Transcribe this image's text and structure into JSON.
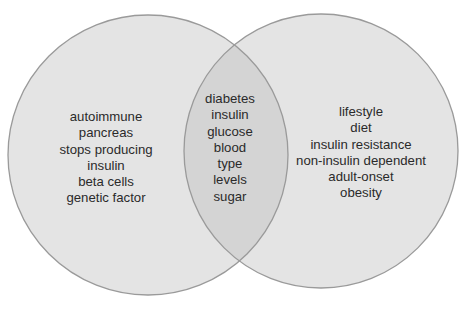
{
  "diagram": {
    "type": "venn",
    "colors": {
      "circle_fill": "#e4e4e4",
      "overlap_fill": "#d4d4d4",
      "circle_stroke": "#9a9a9a",
      "text": "#2a2a2a"
    },
    "sets": [
      {
        "id": "left",
        "terms": [
          "autoimmune",
          "pancreas",
          "stops producing",
          "insulin",
          "beta cells",
          "genetic factor"
        ]
      },
      {
        "id": "right",
        "terms": [
          "lifestyle",
          "diet",
          "insulin resistance",
          "non-insulin dependent",
          "adult-onset",
          "obesity"
        ]
      }
    ],
    "intersection": {
      "terms": [
        "diabetes",
        "insulin",
        "glucose",
        "blood",
        "type",
        "levels",
        "sugar"
      ]
    }
  }
}
